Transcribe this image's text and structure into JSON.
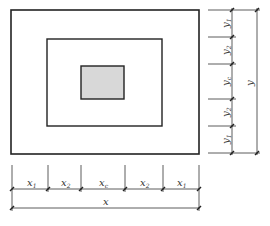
{
  "diagram": {
    "colors": {
      "line": "#222222",
      "dim": "#333333",
      "fill": "#d8d8d8"
    },
    "rects": {
      "outer": {
        "x": 11,
        "y": 10,
        "w": 188,
        "h": 144
      },
      "middle": {
        "x": 47,
        "y": 39,
        "w": 115,
        "h": 87
      },
      "inner": {
        "x": 81,
        "y": 66,
        "w": 43,
        "h": 33
      }
    },
    "x_dims": {
      "ticks": [
        12,
        48,
        81,
        125,
        163,
        199
      ],
      "labels": [
        "x1",
        "x2",
        "xc",
        "x2",
        "x1"
      ],
      "label_main": [
        "x",
        "x",
        "x",
        "x",
        "x"
      ],
      "label_sub": [
        "1",
        "2",
        "c",
        "2",
        "1"
      ],
      "total_label": "x"
    },
    "y_dims": {
      "ticks": [
        10,
        37,
        64,
        99,
        126,
        153
      ],
      "labels": [
        "y1",
        "y2",
        "yc",
        "y2",
        "y1"
      ],
      "label_main": [
        "y",
        "y",
        "y",
        "y",
        "y"
      ],
      "label_sub": [
        "1",
        "2",
        "c",
        "2",
        "1"
      ],
      "total_label": "y"
    }
  }
}
